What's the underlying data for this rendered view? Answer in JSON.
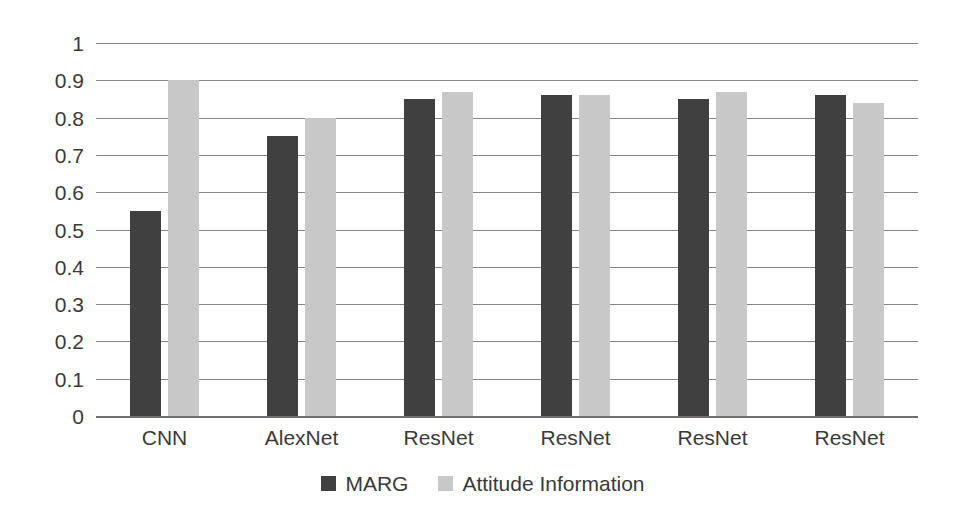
{
  "chart_data": {
    "type": "bar",
    "title": "",
    "subtitle": "",
    "xlabel": "",
    "ylabel": "",
    "categories": [
      "CNN",
      "AlexNet",
      "ResNet",
      "ResNet",
      "ResNet",
      "ResNet"
    ],
    "series": [
      {
        "name": "MARG",
        "color": "#404040",
        "values": [
          0.55,
          0.75,
          0.85,
          0.86,
          0.85,
          0.86
        ]
      },
      {
        "name": "Attitude Information",
        "color": "#c8c8c8",
        "values": [
          0.9,
          0.8,
          0.87,
          0.86,
          0.87,
          0.84
        ]
      }
    ],
    "ylim": [
      0,
      1
    ],
    "ytick_values": [
      1,
      0.9,
      0.8,
      0.7,
      0.6,
      0.5,
      0.4,
      0.3,
      0.2,
      0.1,
      0
    ],
    "ytick_labels": [
      "1",
      "0.9",
      "0.8",
      "0.7",
      "0.6",
      "0.5",
      "0.4",
      "0.3",
      "0.2",
      "0.1",
      "0"
    ],
    "grid": true,
    "grid_axis": "y",
    "legend_position": "bottom",
    "annotations": []
  },
  "colors": {
    "background": "#ffffff",
    "gridline": "#868686",
    "axis": "#6f6f6f",
    "text": "#3a3a3a",
    "series_marg": "#404040",
    "series_attitude": "#c8c8c8"
  }
}
